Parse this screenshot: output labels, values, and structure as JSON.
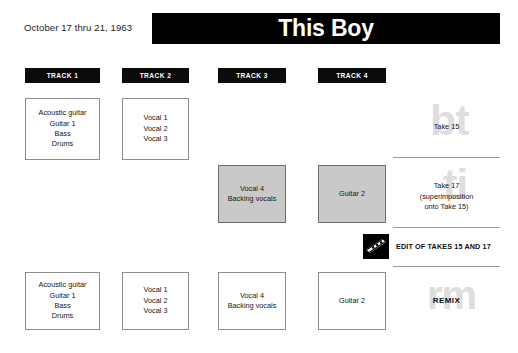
{
  "header": {
    "session_date": "October 17 thru 21, 1963",
    "title": "This Boy"
  },
  "tracks": [
    {
      "label": "TRACK 1",
      "left": 25,
      "width": 75
    },
    {
      "label": "TRACK 2",
      "left": 122,
      "width": 67
    },
    {
      "label": "TRACK 3",
      "left": 218,
      "width": 68
    },
    {
      "label": "TRACK 4",
      "left": 318,
      "width": 68
    }
  ],
  "rows": [
    {
      "name": "take-15",
      "cells": [
        {
          "track": 1,
          "shaded": false,
          "lines": [
            "Acoustic guitar",
            "Guitar 1",
            "Bass",
            "Drums"
          ]
        },
        {
          "track": 2,
          "shaded": false,
          "lines": [
            "Vocal 1",
            "Vocal 2",
            "Vocal 3"
          ]
        },
        {
          "track": 3,
          "shaded": false,
          "lines": []
        },
        {
          "track": 4,
          "shaded": false,
          "lines": []
        }
      ],
      "note": {
        "lines": [
          "Take 15"
        ],
        "watermark": "bt"
      }
    },
    {
      "name": "take-17",
      "cells": [
        {
          "track": 1,
          "shaded": false,
          "lines": []
        },
        {
          "track": 2,
          "shaded": false,
          "lines": []
        },
        {
          "track": 3,
          "shaded": true,
          "lines": [
            "Vocal 4",
            "Backing vocals"
          ]
        },
        {
          "track": 4,
          "shaded": true,
          "lines": [
            "Guitar 2"
          ]
        }
      ],
      "note": {
        "lines": [
          "Take 17",
          "(superimposition",
          "onto Take 15)"
        ],
        "watermark": "ti"
      }
    },
    {
      "name": "remix",
      "cells": [
        {
          "track": 1,
          "shaded": false,
          "lines": [
            "Acoustic guitar",
            "Guitar 1",
            "Bass",
            "Drums"
          ]
        },
        {
          "track": 2,
          "shaded": false,
          "lines": [
            "Vocal 1",
            "Vocal 2",
            "Vocal 3"
          ]
        },
        {
          "track": 3,
          "shaded": false,
          "lines": [
            "Vocal 4",
            "Backing vocals"
          ]
        },
        {
          "track": 4,
          "shaded": false,
          "lines": [
            "Guitar 2"
          ]
        }
      ],
      "note": {
        "lines": [],
        "watermark": "rm"
      }
    }
  ],
  "edit_row": {
    "icon": "razor-blade-icon",
    "label": "EDIT OF TAKES 15 AND 17"
  },
  "remix_label": "REMIX",
  "colors": {
    "bar_black": "#000000",
    "shaded_cell": "#c9c9c9",
    "cell_border": "#8d8d8d",
    "watermark": "#dedede",
    "divider": "#9a9a9a"
  }
}
